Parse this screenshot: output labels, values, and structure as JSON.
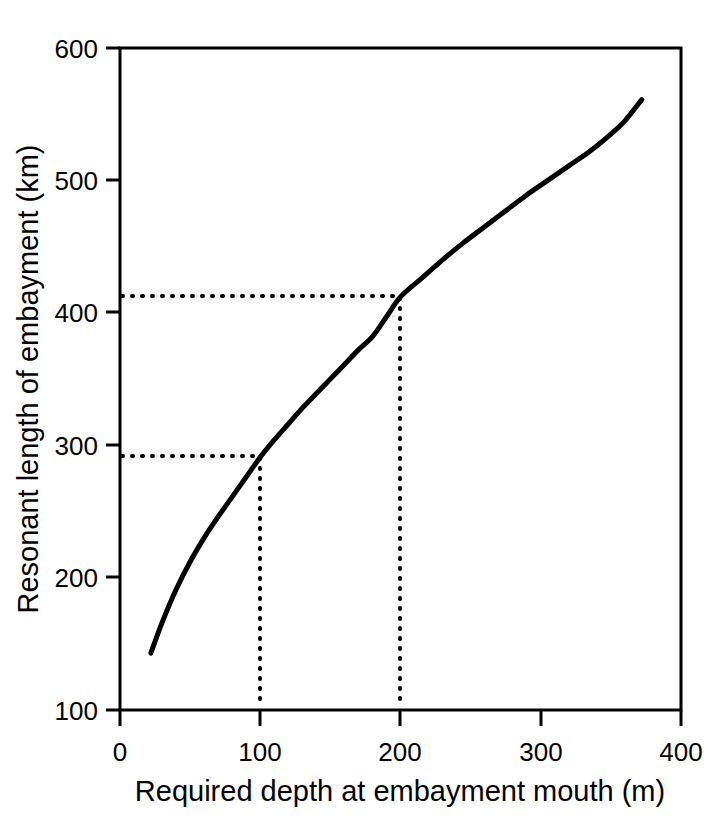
{
  "chart_data": {
    "type": "line",
    "title": "",
    "subtitle": "",
    "xlabel": "Required depth at embayment mouth (m)",
    "ylabel": "Resonant length of embayment (km)",
    "xlim": [
      0,
      400
    ],
    "ylim": [
      100,
      600
    ],
    "xticks": [
      0,
      100,
      200,
      300,
      400
    ],
    "yticks": [
      100,
      200,
      300,
      400,
      500,
      600
    ],
    "xtick_labels": [
      "0",
      "100",
      "200",
      "300",
      "400"
    ],
    "ytick_labels": [
      "100",
      "200",
      "300",
      "400",
      "500",
      "600"
    ],
    "grid": false,
    "legend": "none",
    "line_color": "#000000",
    "axis_color": "#000000",
    "background_color": "#ffffff",
    "series": [
      {
        "name": "Resonant length vs required depth",
        "x": [
          22,
          30,
          40,
          50,
          60,
          70,
          80,
          90,
          100,
          110,
          120,
          130,
          140,
          150,
          160,
          170,
          180,
          190,
          200,
          215,
          230,
          245,
          260,
          275,
          290,
          305,
          320,
          335,
          350,
          360,
          372
        ],
        "y": [
          143,
          166,
          191,
          212,
          230,
          246,
          261,
          276,
          291,
          304,
          316,
          328,
          339,
          350,
          361,
          372,
          382,
          397,
          412,
          426,
          440,
          453,
          465,
          477,
          489,
          500,
          511,
          522,
          535,
          545,
          561
        ]
      }
    ],
    "annotations": [
      {
        "name": "guide-line-lower",
        "style": "dotted",
        "x": 100,
        "y": 291,
        "description": "Dotted guide lines from y-axis to curve at depth 100 m, length 291 km"
      },
      {
        "name": "guide-line-upper",
        "style": "dotted",
        "x": 200,
        "y": 412,
        "description": "Dotted guide lines from y-axis to curve at depth 200 m, length 412 km"
      }
    ]
  },
  "axes": {
    "x_title": "Required depth at embayment mouth (m)",
    "y_title": "Resonant length of embayment (km)",
    "x_ticks": [
      {
        "value": 0,
        "label": "0"
      },
      {
        "value": 100,
        "label": "100"
      },
      {
        "value": 200,
        "label": "200"
      },
      {
        "value": 300,
        "label": "300"
      },
      {
        "value": 400,
        "label": "400"
      }
    ],
    "y_ticks": [
      {
        "value": 100,
        "label": "100"
      },
      {
        "value": 200,
        "label": "200"
      },
      {
        "value": 300,
        "label": "300"
      },
      {
        "value": 400,
        "label": "400"
      },
      {
        "value": 500,
        "label": "500"
      },
      {
        "value": 600,
        "label": "600"
      }
    ]
  }
}
